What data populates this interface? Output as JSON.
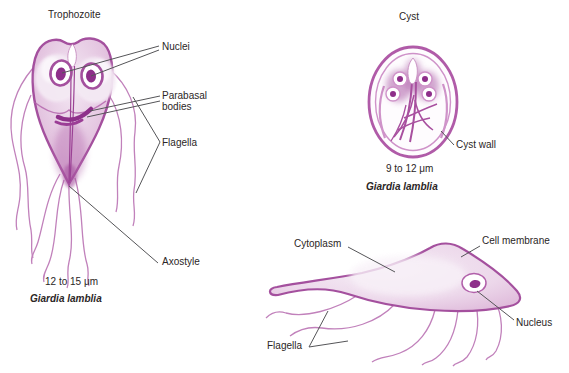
{
  "palette": {
    "outline": "#a4509e",
    "dark_accent": "#8e2f8a",
    "body_fill": "#e3c3df",
    "body_fill_light": "#f4eaf4",
    "flagella": "#c181bb",
    "leader_line": "#555558",
    "text": "#2b2626",
    "background": "#ffffff"
  },
  "trophozoite_front": {
    "title": "Trophozoite",
    "labels": {
      "nuclei": "Nuclei",
      "parabasal_bodies": "Parabasal bodies",
      "flagella": "Flagella",
      "axostyle": "Axostyle"
    },
    "size": "12 to 15 μm",
    "species": "Giardia lamblia"
  },
  "cyst": {
    "title": "Cyst",
    "labels": {
      "cyst_wall": "Cyst wall"
    },
    "size": "9 to 12 μm",
    "species": "Giardia lamblia"
  },
  "trophozoite_side": {
    "labels": {
      "cytoplasm": "Cytoplasm",
      "cell_membrane": "Cell membrane",
      "nucleus": "Nucleus",
      "flagella": "Flagella"
    }
  }
}
